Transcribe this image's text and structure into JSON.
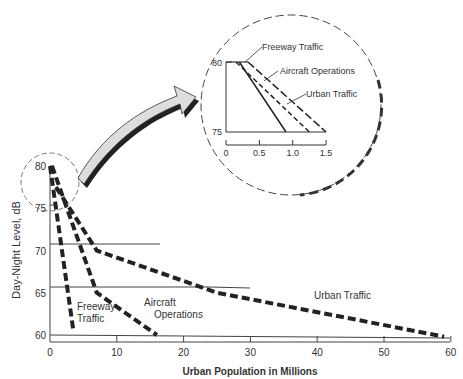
{
  "chart_data": {
    "type": "line",
    "title": "",
    "xlabel": "Urban Population in Millions",
    "ylabel": "Day-Night Level, dB",
    "xlim": [
      0,
      60
    ],
    "ylim": [
      60,
      80
    ],
    "x_ticks": [
      0,
      10,
      20,
      30,
      40,
      50,
      60
    ],
    "y_ticks": [
      60,
      65,
      70,
      75,
      80
    ],
    "grid": "horizontal lines at 60, 65, 70",
    "series": [
      {
        "name": "Freeway Traffic",
        "label_lines": [
          "Freeway",
          "Traffic"
        ],
        "x": [
          0,
          3.5
        ],
        "y": [
          80,
          60.5
        ]
      },
      {
        "name": "Aircraft Operations",
        "label_lines": [
          "Aircraft",
          "Operations"
        ],
        "x": [
          0.3,
          7,
          16
        ],
        "y": [
          80,
          65,
          60
        ]
      },
      {
        "name": "Urban Traffic",
        "label_lines": [
          "Urban Traffic"
        ],
        "x": [
          0.9,
          7,
          25,
          59
        ],
        "y": [
          77.5,
          70,
          65,
          59.8
        ]
      }
    ],
    "inset": {
      "description": "Magnified view of region x 0-1.5, y 75-80",
      "xlim": [
        0,
        1.5
      ],
      "ylim": [
        75,
        80
      ],
      "x_ticks": [
        "0",
        "0.5",
        "1.0",
        "1.5"
      ],
      "y_ticks": [
        "75",
        "80"
      ],
      "series": [
        {
          "name": "Freeway Traffic",
          "style": "solid",
          "x": [
            0.2,
            0.9
          ],
          "y": [
            80,
            75
          ]
        },
        {
          "name": "Aircraft Operations",
          "style": "long-dash",
          "x": [
            0.33,
            1.5
          ],
          "y": [
            80,
            75
          ]
        },
        {
          "name": "Urban Traffic",
          "style": "short-dash",
          "x": [
            0.15,
            1.25
          ],
          "y": [
            80,
            75
          ]
        }
      ],
      "labels": [
        "Freeway Traffic",
        "Aircraft Operations",
        "Urban Traffic"
      ]
    }
  }
}
